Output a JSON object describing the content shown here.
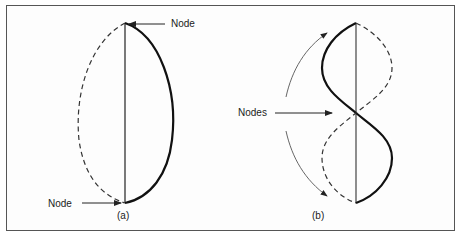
{
  "figure": {
    "panel_a": {
      "caption": "(a)",
      "top_label": "Node",
      "bottom_label": "Node",
      "description": "Fundamental mode: string fixed at two end nodes, solid and dashed half-wave displacement"
    },
    "panel_b": {
      "caption": "(b)",
      "middle_label": "Nodes",
      "description": "Second harmonic: string with three nodes, full wave displacement with rotation arrows"
    },
    "colors": {
      "line": "#111111",
      "frame": "#555555",
      "arrow": "#444444",
      "background": "#ffffff"
    }
  }
}
